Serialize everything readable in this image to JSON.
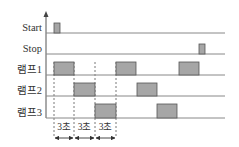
{
  "diagram": {
    "type": "timing-diagram",
    "colors": {
      "pulse_fill": "#a6a6a6",
      "pulse_stroke": "#555555",
      "line": "#888888",
      "axis": "#555555",
      "text": "#333333"
    },
    "signals": [
      {
        "label": "Start",
        "baseline_y": 33,
        "top_y": 23,
        "pulses": [
          [
            54,
            60
          ]
        ]
      },
      {
        "label": "Stop",
        "baseline_y": 54,
        "top_y": 44,
        "pulses": [
          [
            199,
            205
          ]
        ]
      },
      {
        "label": "램프1",
        "baseline_y": 75,
        "top_y": 62,
        "pulses": [
          [
            54,
            74
          ],
          [
            116,
            136
          ],
          [
            179,
            199
          ]
        ]
      },
      {
        "label": "램프2",
        "baseline_y": 96,
        "top_y": 83,
        "pulses": [
          [
            74,
            95
          ],
          [
            137,
            157
          ]
        ]
      },
      {
        "label": "램프3",
        "baseline_y": 118,
        "top_y": 104,
        "pulses": [
          [
            95,
            116
          ],
          [
            157,
            177
          ]
        ]
      }
    ],
    "durations": [
      {
        "label": "3초",
        "from_x": 54,
        "to_x": 74
      },
      {
        "label": "3초",
        "from_x": 74,
        "to_x": 95
      },
      {
        "label": "3초",
        "from_x": 95,
        "to_x": 116
      }
    ],
    "dashed_markers_x": [
      54,
      74,
      95,
      116
    ]
  }
}
